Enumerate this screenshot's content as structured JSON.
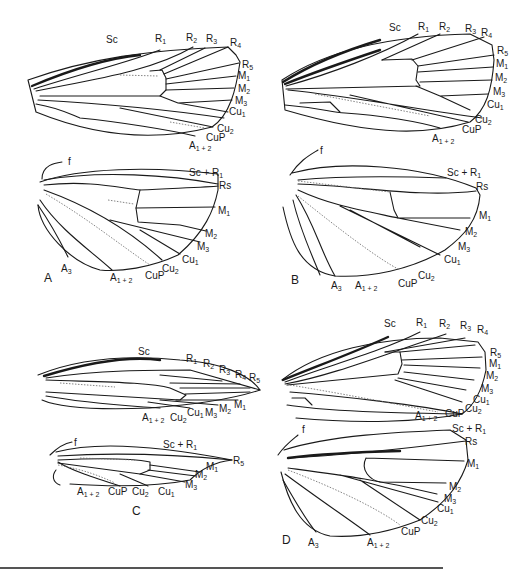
{
  "figure": {
    "type": "insect wing venation diagram",
    "panels": [
      {
        "id": "A",
        "forewing_labels": [
          "Sc",
          "R1",
          "R2",
          "R3",
          "R4",
          "R5",
          "M1",
          "M2",
          "M3",
          "Cu1",
          "Cu2",
          "CuP",
          "A1+2"
        ],
        "hindwing_labels": [
          "f",
          "Sc + R1",
          "Rs",
          "M1",
          "M2",
          "M3",
          "Cu1",
          "Cu2",
          "CuP",
          "A1+2",
          "A3"
        ]
      },
      {
        "id": "B",
        "forewing_labels": [
          "Sc",
          "R1",
          "R2",
          "R3",
          "R4",
          "R5",
          "M1",
          "M2",
          "M3",
          "Cu1",
          "Cu2",
          "CuP",
          "A1+2"
        ],
        "hindwing_labels": [
          "f",
          "Sc + R1",
          "Rs",
          "M1",
          "M2",
          "M3",
          "Cu1",
          "Cu2",
          "CuP",
          "A1+2",
          "A3"
        ]
      },
      {
        "id": "C",
        "forewing_labels": [
          "Sc",
          "R1",
          "R2",
          "R3",
          "R4",
          "R5",
          "M1",
          "M2",
          "M3",
          "Cu1",
          "Cu2",
          "A1+2"
        ],
        "hindwing_labels": [
          "f",
          "Sc + R1",
          "R5",
          "M1",
          "M2",
          "M3",
          "Cu1",
          "Cu2",
          "CuP",
          "A1+2"
        ]
      },
      {
        "id": "D",
        "forewing_labels": [
          "Sc",
          "R1",
          "R2",
          "R3",
          "R4",
          "R5",
          "M1",
          "M2",
          "M3",
          "Cu1",
          "Cu2",
          "CuP",
          "A1+2"
        ],
        "hindwing_labels": [
          "f",
          "Sc + R1",
          "Rs",
          "M1",
          "M2",
          "M3",
          "Cu1",
          "Cu2",
          "CuP",
          "A1+2",
          "A3"
        ]
      }
    ]
  },
  "panel_letters": {
    "a": "A",
    "b": "B",
    "c": "C",
    "d": "D"
  },
  "labels": {
    "Sc": "Sc",
    "R": "R",
    "M": "M",
    "Cu": "Cu",
    "CuP": "CuP",
    "A": "A",
    "Rs": "Rs",
    "f": "f",
    "ScR": "Sc + R",
    "n1": "1",
    "n2": "2",
    "n3": "3",
    "n4": "4",
    "n5": "5",
    "n12": "1 + 2"
  }
}
